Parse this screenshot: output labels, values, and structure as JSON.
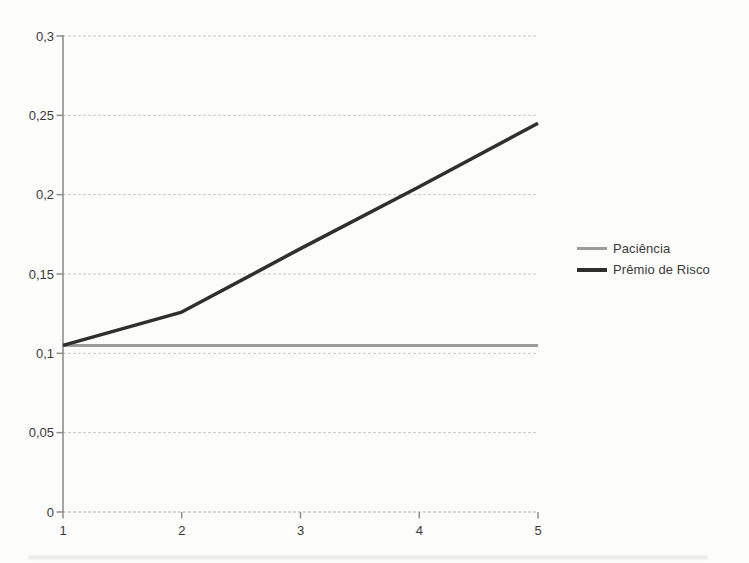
{
  "chart_data": {
    "type": "line",
    "x": [
      1,
      2,
      3,
      4,
      5
    ],
    "x_tick_labels": [
      "1",
      "2",
      "3",
      "4",
      "5"
    ],
    "xlim": [
      1,
      5
    ],
    "ylim": [
      0,
      0.3
    ],
    "y_ticks": [
      {
        "value": 0,
        "label": "0"
      },
      {
        "value": 0.05,
        "label": "0,05"
      },
      {
        "value": 0.1,
        "label": "0,1"
      },
      {
        "value": 0.15,
        "label": "0,15"
      },
      {
        "value": 0.2,
        "label": "0,2"
      },
      {
        "value": 0.25,
        "label": "0,25"
      },
      {
        "value": 0.3,
        "label": "0,3"
      }
    ],
    "grid": true,
    "legend_position": "right",
    "series": [
      {
        "name": "Paciência",
        "values": [
          0.105,
          0.105,
          0.105,
          0.105,
          0.105
        ],
        "color": "#9b9b9b"
      },
      {
        "name": "Prêmio de Risco",
        "values": [
          0.105,
          0.126,
          0.166,
          0.205,
          0.245
        ],
        "color": "#2f2f2f"
      }
    ],
    "colors": {
      "gridline": "#c9c9c9",
      "baseline": "#b0b0b0",
      "axis": "#8f8f8f",
      "tick_text": "#3a3a3a"
    }
  }
}
